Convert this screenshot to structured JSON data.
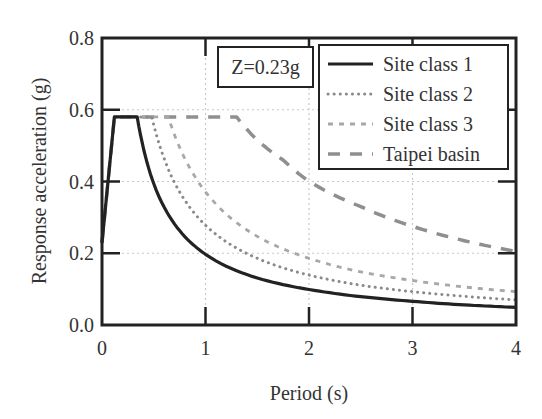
{
  "chart_data": {
    "type": "line",
    "title": "",
    "xlabel": "Period (s)",
    "ylabel": "Response acceleration (g)",
    "xlim": [
      0,
      4
    ],
    "ylim": [
      0,
      0.8
    ],
    "xticks": [
      "0",
      "1",
      "2",
      "3",
      "4"
    ],
    "yticks": [
      "0.0",
      "0.2",
      "0.4",
      "0.6",
      "0.8"
    ],
    "grid": true,
    "legend_position": "upper right",
    "annotation": "Z=0.23g",
    "x": [
      0,
      0.12,
      0.34,
      0.5,
      0.65,
      1.3,
      1.5,
      2.0,
      2.5,
      3.0,
      3.5,
      4.0
    ],
    "series": [
      {
        "name": "Site class 1",
        "style": "solid",
        "color": "#222222",
        "points": [
          [
            0,
            0.23
          ],
          [
            0.12,
            0.58
          ],
          [
            0.34,
            0.58
          ],
          [
            0.5,
            0.394
          ],
          [
            0.75,
            0.263
          ],
          [
            1.0,
            0.197
          ],
          [
            1.5,
            0.131
          ],
          [
            2.0,
            0.099
          ],
          [
            2.5,
            0.079
          ],
          [
            3.0,
            0.066
          ],
          [
            3.5,
            0.056
          ],
          [
            4.0,
            0.049
          ]
        ]
      },
      {
        "name": "Site class 2",
        "style": "dotted",
        "color": "#8a8a8a",
        "points": [
          [
            0,
            0.23
          ],
          [
            0.12,
            0.58
          ],
          [
            0.48,
            0.58
          ],
          [
            0.75,
            0.371
          ],
          [
            1.0,
            0.278
          ],
          [
            1.5,
            0.186
          ],
          [
            2.0,
            0.139
          ],
          [
            2.5,
            0.111
          ],
          [
            3.0,
            0.093
          ],
          [
            3.5,
            0.08
          ],
          [
            4.0,
            0.07
          ]
        ]
      },
      {
        "name": "Site class 3",
        "style": "dashed-short",
        "color": "#a8a8a8",
        "points": [
          [
            0,
            0.23
          ],
          [
            0.12,
            0.58
          ],
          [
            0.64,
            0.58
          ],
          [
            0.75,
            0.495
          ],
          [
            1.0,
            0.371
          ],
          [
            1.5,
            0.247
          ],
          [
            2.0,
            0.186
          ],
          [
            2.5,
            0.148
          ],
          [
            3.0,
            0.124
          ],
          [
            3.5,
            0.106
          ],
          [
            4.0,
            0.093
          ]
        ]
      },
      {
        "name": "Taipei basin",
        "style": "dashed-long",
        "color": "#8f8f8f",
        "points": [
          [
            0,
            0.23
          ],
          [
            0.12,
            0.58
          ],
          [
            1.3,
            0.58
          ],
          [
            1.5,
            0.515
          ],
          [
            1.75,
            0.46
          ],
          [
            2.0,
            0.4
          ],
          [
            2.5,
            0.33
          ],
          [
            3.0,
            0.275
          ],
          [
            3.5,
            0.235
          ],
          [
            4.0,
            0.205
          ]
        ]
      }
    ]
  }
}
